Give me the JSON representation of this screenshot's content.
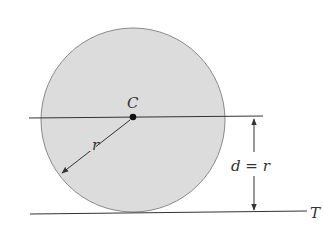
{
  "diagram": {
    "center_label": "C",
    "radius_label": "r",
    "distance_label": "d = r",
    "line_label": "T",
    "colors": {
      "circle_fill": "#dcdcdc",
      "circle_stroke": "#8a8a8a",
      "line": "#333333"
    }
  }
}
